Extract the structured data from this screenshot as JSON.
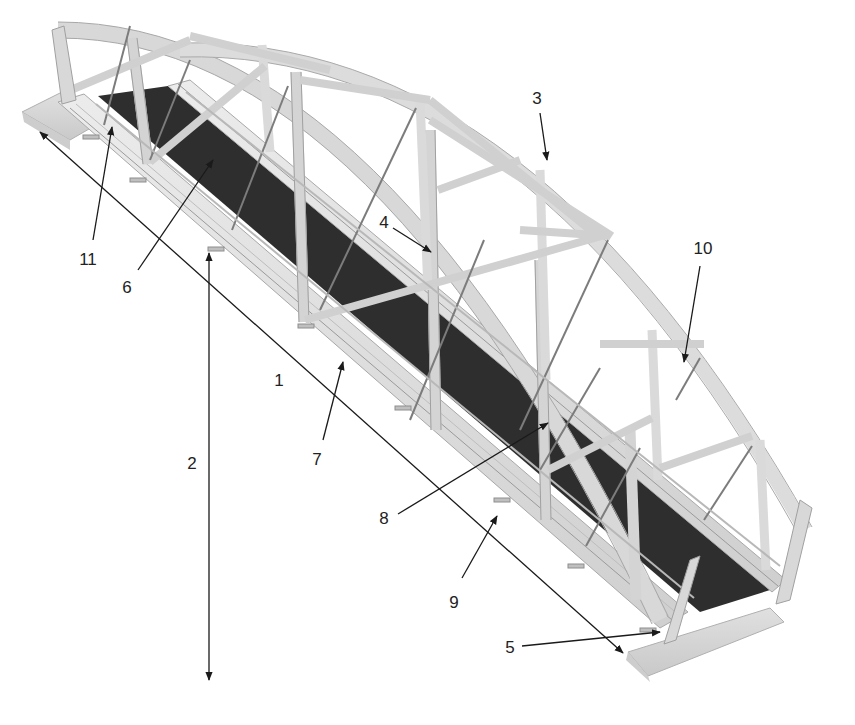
{
  "figure": {
    "type": "technical-illustration",
    "colors": {
      "background": "#ffffff",
      "steel_light": "#e2e2e2",
      "steel_mid": "#c4c4c4",
      "steel_edge": "#9a9a9a",
      "deck": "#2e2e2e",
      "abutment": "#d6d6d6",
      "leader_line": "#1a1a1a",
      "label_text": "#222222"
    }
  },
  "callouts": [
    {
      "id": "1",
      "label": "1",
      "x": 279,
      "y": 380,
      "target": "overall span length (dimension line)"
    },
    {
      "id": "2",
      "label": "2",
      "x": 192,
      "y": 463,
      "target": "height / clearance (vertical dimension line)"
    },
    {
      "id": "3",
      "label": "3",
      "x": 537,
      "y": 98,
      "target": "top arch chord"
    },
    {
      "id": "4",
      "label": "4",
      "x": 384,
      "y": 222,
      "target": "transverse top bracing"
    },
    {
      "id": "5",
      "label": "5",
      "x": 510,
      "y": 647,
      "target": "end bearing at abutment"
    },
    {
      "id": "6",
      "label": "6",
      "x": 127,
      "y": 287,
      "target": "deck surface"
    },
    {
      "id": "7",
      "label": "7",
      "x": 317,
      "y": 459,
      "target": "bottom chord / side stringer"
    },
    {
      "id": "8",
      "label": "8",
      "x": 384,
      "y": 518,
      "target": "diagonal tension rod"
    },
    {
      "id": "9",
      "label": "9",
      "x": 454,
      "y": 602,
      "target": "floor beam bracket"
    },
    {
      "id": "10",
      "label": "10",
      "x": 703,
      "y": 248,
      "target": "vertical hanger"
    },
    {
      "id": "11",
      "label": "11",
      "x": 88,
      "y": 259,
      "target": "railing post"
    }
  ],
  "dimension_lines": [
    {
      "name": "span-dimension",
      "x1": 40,
      "y1": 132,
      "x2": 623,
      "y2": 653,
      "arrows": "both"
    },
    {
      "name": "height-dimension",
      "x1": 209,
      "y1": 253,
      "x2": 209,
      "y2": 680,
      "arrows": "both"
    }
  ],
  "leaders": [
    {
      "for": "3",
      "x1": 540,
      "y1": 113,
      "x2": 547,
      "y2": 160
    },
    {
      "for": "4",
      "x1": 393,
      "y1": 228,
      "x2": 431,
      "y2": 252
    },
    {
      "for": "5",
      "x1": 522,
      "y1": 646,
      "x2": 660,
      "y2": 632
    },
    {
      "for": "6",
      "x1": 138,
      "y1": 270,
      "x2": 213,
      "y2": 160
    },
    {
      "for": "7",
      "x1": 323,
      "y1": 440,
      "x2": 343,
      "y2": 362
    },
    {
      "for": "8",
      "x1": 398,
      "y1": 514,
      "x2": 548,
      "y2": 423
    },
    {
      "for": "9",
      "x1": 462,
      "y1": 578,
      "x2": 497,
      "y2": 516
    },
    {
      "for": "10",
      "x1": 700,
      "y1": 266,
      "x2": 684,
      "y2": 362
    },
    {
      "for": "11",
      "x1": 93,
      "y1": 240,
      "x2": 112,
      "y2": 127
    }
  ]
}
